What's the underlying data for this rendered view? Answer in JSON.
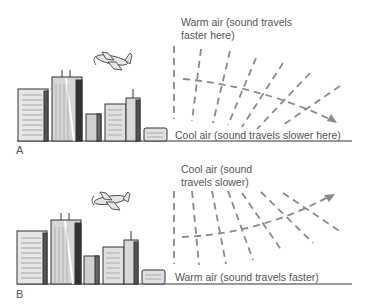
{
  "figure": {
    "panels": [
      {
        "letter": "A",
        "top_label_line1": "Warm air (sound travels",
        "top_label_line2": "faster here)",
        "bottom_label": "Cool air (sound travels slower here)",
        "ray_direction": "bends downward"
      },
      {
        "letter": "B",
        "top_label_line1": "Cool air (sound",
        "top_label_line2": "travels slower)",
        "bottom_label": "Warm air (sound travels faster)",
        "ray_direction": "bends upward"
      }
    ],
    "icons": [
      "city-skyline-icon",
      "airplane-icon",
      "arrow-icon"
    ],
    "colors": {
      "line": "#8a8a8a",
      "text": "#555555",
      "ground": "#333333",
      "building_fill": "#d9d9d9",
      "building_dark": "#333333"
    }
  }
}
